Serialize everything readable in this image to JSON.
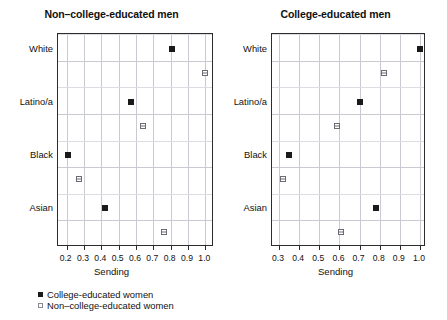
{
  "chart_data": {
    "type": "scatter",
    "title": "",
    "xlabel": "Sending",
    "ylabel": "",
    "grid": true,
    "legend_position": "bottom-left",
    "categories": [
      "White",
      "Latino/a",
      "Black",
      "Asian"
    ],
    "legend": [
      {
        "key": "college_educated_women",
        "label": "College-educated women",
        "marker": "filled-square",
        "color": "#1a1a1a"
      },
      {
        "key": "non_college_educated_women",
        "label": "Non–college-educated women",
        "marker": "open-square",
        "color": "#6b6b75"
      }
    ],
    "panels": [
      {
        "id": "non-college-educated-men",
        "title": "Non–college-educated men",
        "xlabel": "Sending",
        "xlim": [
          0.15,
          1.05
        ],
        "xticks": [
          0.2,
          0.3,
          0.4,
          0.5,
          0.6,
          0.7,
          0.8,
          0.9,
          1.0
        ],
        "xtick_labels": [
          "0.2",
          "0.3",
          "0.4",
          "0.5",
          "0.6",
          "0.7",
          "0.8",
          "0.9",
          "1.0"
        ],
        "yticks": [
          "White",
          "Latino/a",
          "Black",
          "Asian"
        ],
        "series": [
          {
            "name": "College-educated women",
            "marker": "filled-square",
            "values": [
              0.81,
              0.57,
              0.21,
              0.42
            ]
          },
          {
            "name": "Non–college-educated women",
            "marker": "open-square",
            "values": [
              1.0,
              0.64,
              0.27,
              0.76
            ]
          }
        ]
      },
      {
        "id": "college-educated-men",
        "title": "College-educated men",
        "xlabel": "Sending",
        "xlim": [
          0.265,
          1.03
        ],
        "xticks": [
          0.3,
          0.4,
          0.5,
          0.6,
          0.7,
          0.8,
          0.9,
          1.0
        ],
        "xtick_labels": [
          "0.3",
          "0.4",
          "0.5",
          "0.6",
          "0.7",
          "0.8",
          "0.9",
          "1.0"
        ],
        "yticks": [
          "White",
          "Latino/a",
          "Black",
          "Asian"
        ],
        "series": [
          {
            "name": "College-educated women",
            "marker": "filled-square",
            "values": [
              1.0,
              0.7,
              0.35,
              0.78
            ]
          },
          {
            "name": "Non–college-educated women",
            "marker": "open-square",
            "values": [
              0.82,
              0.59,
              0.32,
              0.61
            ]
          }
        ]
      }
    ]
  }
}
